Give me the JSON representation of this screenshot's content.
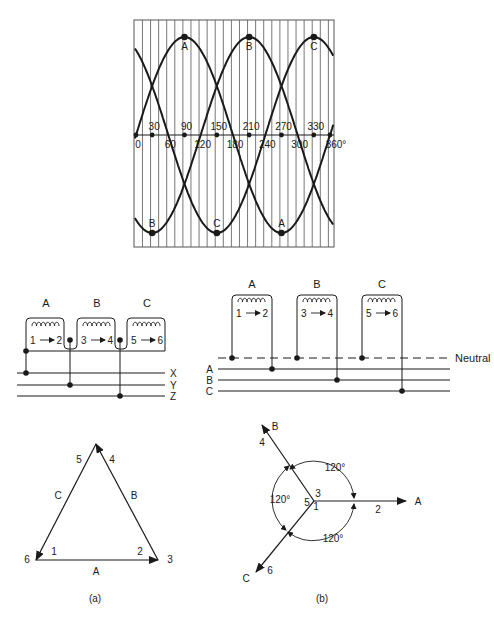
{
  "waveform": {
    "x_ticks_top": [
      "30",
      "90",
      "150",
      "210",
      "270",
      "330"
    ],
    "x_ticks_bottom": [
      "0",
      "60",
      "120",
      "180",
      "240",
      "300",
      "360°"
    ],
    "peak_labels": [
      "A",
      "B",
      "C"
    ],
    "trough_labels": [
      "B",
      "C",
      "A"
    ]
  },
  "delta_wiring": {
    "coils": [
      {
        "label": "A",
        "from": "1",
        "to": "2"
      },
      {
        "label": "B",
        "from": "3",
        "to": "4"
      },
      {
        "label": "C",
        "from": "5",
        "to": "6"
      }
    ],
    "lines": [
      "X",
      "Y",
      "Z"
    ]
  },
  "wye_wiring": {
    "coils": [
      {
        "label": "A",
        "from": "1",
        "to": "2"
      },
      {
        "label": "B",
        "from": "3",
        "to": "4"
      },
      {
        "label": "C",
        "from": "5",
        "to": "6"
      }
    ],
    "neutral_label": "Neutral",
    "lines": [
      "A",
      "B",
      "C"
    ]
  },
  "delta_phasor": {
    "caption": "(a)",
    "sides": [
      "A",
      "B",
      "C"
    ],
    "vertex_labels": {
      "top_left": "5",
      "top_right": "4",
      "bl_outer": "6",
      "bl_inner": "1",
      "br_inner": "2",
      "br_outer": "3"
    }
  },
  "wye_phasor": {
    "caption": "(b)",
    "phasors": [
      {
        "label": "A",
        "terminal": "2"
      },
      {
        "label": "B",
        "terminal": "4"
      },
      {
        "label": "C",
        "terminal": "6"
      }
    ],
    "center_labels": [
      "3",
      "5",
      "1"
    ],
    "angles": [
      "120°",
      "120°",
      "120°"
    ]
  },
  "chart_data": {
    "type": "line",
    "title": "",
    "xlabel": "degrees",
    "ylabel": "",
    "x_ticks": [
      0,
      30,
      60,
      90,
      120,
      150,
      180,
      210,
      240,
      270,
      300,
      330,
      360
    ],
    "xlim": [
      0,
      360
    ],
    "ylim": [
      -1,
      1
    ],
    "grid": "vertical lines every 15°",
    "series": [
      {
        "name": "A",
        "function": "sin(θ)",
        "peak_at": 90,
        "trough_at": 270
      },
      {
        "name": "B",
        "function": "sin(θ-120°)",
        "peak_at": 210,
        "trough_at": 30
      },
      {
        "name": "C",
        "function": "sin(θ-240°)",
        "peak_at": 330,
        "trough_at": 150
      }
    ]
  }
}
